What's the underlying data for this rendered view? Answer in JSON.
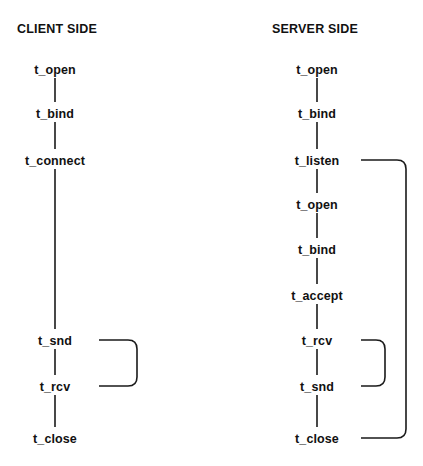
{
  "figure": {
    "title": "",
    "background_color": "#ffffff",
    "line_color": "#1a1a1a",
    "text_color": "#111111"
  },
  "columns": [
    {
      "id": "client",
      "title": "CLIENT SIDE",
      "title_x": 17,
      "title_y": 33,
      "axis_x": 55,
      "nodes": [
        {
          "label": "t_open",
          "x": 55,
          "y": 69
        },
        {
          "label": "t_bind",
          "x": 55,
          "y": 113
        },
        {
          "label": "t_connect",
          "x": 55,
          "y": 160
        },
        {
          "label": "t_snd",
          "x": 55,
          "y": 340
        },
        {
          "label": "t_rcv",
          "x": 55,
          "y": 386
        },
        {
          "label": "t_close",
          "x": 55,
          "y": 438
        }
      ],
      "edges": [
        {
          "from": "t_open",
          "to": "t_bind",
          "y1": 75,
          "y2": 104
        },
        {
          "from": "t_bind",
          "to": "t_connect",
          "y1": 119,
          "y2": 150
        },
        {
          "from": "t_connect",
          "to": "t_snd",
          "y1": 167,
          "y2": 331
        },
        {
          "from": "t_snd",
          "to": "t_rcv",
          "y1": 346,
          "y2": 377
        },
        {
          "from": "t_rcv",
          "to": "t_close",
          "y1": 392,
          "y2": 429
        }
      ],
      "loops": [
        {
          "id": "client-send-receive-loop",
          "from": "t_rcv",
          "to": "t_snd",
          "start_x": 88,
          "start_y": 386,
          "right_x": 137,
          "end_x": 85,
          "end_y": 340
        }
      ]
    },
    {
      "id": "server",
      "title": "SERVER SIDE",
      "title_x": 272,
      "title_y": 33,
      "axis_x": 317,
      "nodes": [
        {
          "label": "t_open",
          "x": 317,
          "y": 69
        },
        {
          "label": "t_bind",
          "x": 317,
          "y": 113
        },
        {
          "label": "t_listen",
          "x": 317,
          "y": 160
        },
        {
          "label": "t_open",
          "x": 317,
          "y": 204
        },
        {
          "label": "t_bind",
          "x": 317,
          "y": 249
        },
        {
          "label": "t_accept",
          "x": 317,
          "y": 295
        },
        {
          "label": "t_rcv",
          "x": 317,
          "y": 340
        },
        {
          "label": "t_snd",
          "x": 317,
          "y": 386
        },
        {
          "label": "t_close",
          "x": 317,
          "y": 438
        }
      ],
      "edges": [
        {
          "from": "t_open",
          "to": "t_bind",
          "y1": 75,
          "y2": 104
        },
        {
          "from": "t_bind",
          "to": "t_listen",
          "y1": 119,
          "y2": 150
        },
        {
          "from": "t_listen",
          "to": "t_open",
          "y1": 166,
          "y2": 195
        },
        {
          "from": "t_open",
          "to": "t_bind",
          "y1": 210,
          "y2": 240
        },
        {
          "from": "t_bind",
          "to": "t_accept",
          "y1": 255,
          "y2": 286
        },
        {
          "from": "t_accept",
          "to": "t_rcv",
          "y1": 301,
          "y2": 331
        },
        {
          "from": "t_rcv",
          "to": "t_snd",
          "y1": 346,
          "y2": 377
        },
        {
          "from": "t_snd",
          "to": "t_close",
          "y1": 392,
          "y2": 429
        }
      ],
      "loops": [
        {
          "id": "server-receive-send-loop",
          "from": "t_snd",
          "to": "t_rcv",
          "start_x": 344,
          "start_y": 386,
          "right_x": 385,
          "end_x": 342,
          "end_y": 340
        },
        {
          "id": "server-close-listen-loop",
          "from": "t_close",
          "to": "t_listen",
          "start_x": 352,
          "start_y": 438,
          "right_x": 406,
          "end_x": 348,
          "end_y": 160
        }
      ]
    }
  ]
}
